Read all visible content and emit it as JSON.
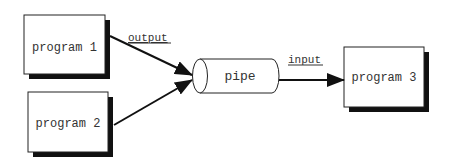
{
  "diagram": {
    "nodes": [
      {
        "id": "program1",
        "label": "program 1",
        "type": "box"
      },
      {
        "id": "program2",
        "label": "program 2",
        "type": "box"
      },
      {
        "id": "pipe",
        "label": "pipe",
        "type": "cylinder"
      },
      {
        "id": "program3",
        "label": "program 3",
        "type": "box"
      }
    ],
    "edges": [
      {
        "from": "program1",
        "to": "pipe",
        "label": "output"
      },
      {
        "from": "program2",
        "to": "pipe",
        "label": ""
      },
      {
        "from": "pipe",
        "to": "program3",
        "label": "input"
      }
    ],
    "labels": {
      "program1": "program 1",
      "program2": "program 2",
      "pipe": "pipe",
      "program3": "program 3",
      "output": "output",
      "input": "input"
    }
  }
}
